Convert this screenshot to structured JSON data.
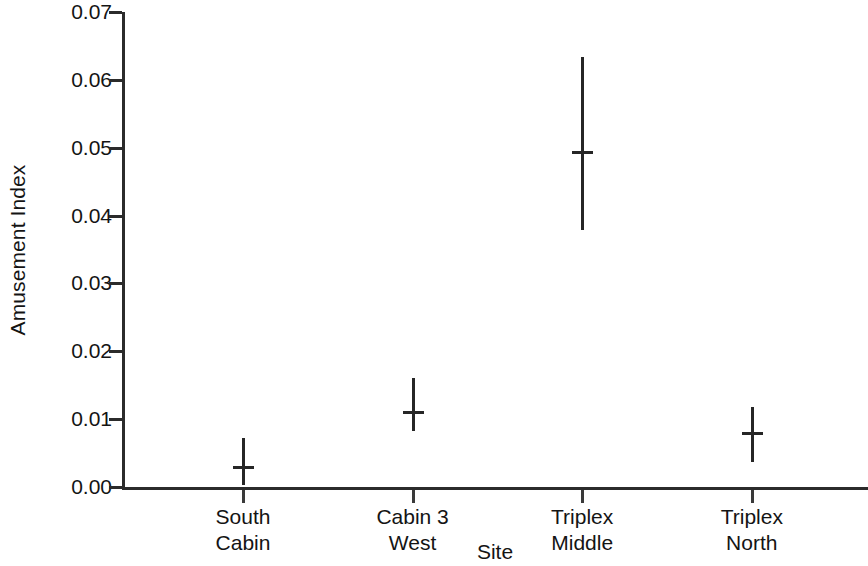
{
  "chart_data": {
    "type": "scatter",
    "title": "",
    "xlabel": "Site",
    "ylabel": "Amusement Index",
    "categories": [
      "South\nCabin",
      "Cabin 3\nWest",
      "Triplex\nMiddle",
      "Triplex\nNorth"
    ],
    "category_lines": [
      [
        "South",
        "Cabin"
      ],
      [
        "Cabin 3",
        "West"
      ],
      [
        "Triplex",
        "Middle"
      ],
      [
        "Triplex",
        "North"
      ]
    ],
    "values": [
      0.0029,
      0.0111,
      0.0494,
      0.008
    ],
    "error_low": [
      0.0003,
      0.0083,
      0.0379,
      0.0037
    ],
    "error_high": [
      0.0072,
      0.0161,
      0.0634,
      0.0118
    ],
    "ylim": [
      0.0,
      0.07
    ],
    "yticks": [
      0.0,
      0.01,
      0.02,
      0.03,
      0.04,
      0.05,
      0.06,
      0.07
    ],
    "ytick_labels": [
      "0.00",
      "0.01",
      "0.02",
      "0.03",
      "0.04",
      "0.05",
      "0.06",
      "0.07"
    ],
    "grid": false,
    "legend": null,
    "marker": "error-bar-with-mean-tick",
    "series_color": "#262626",
    "axis_color": "#2b2b2b",
    "background": "#ffffff"
  }
}
